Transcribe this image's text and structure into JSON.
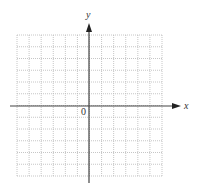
{
  "diagram": {
    "type": "coordinate-grid",
    "x_axis_label": "x",
    "y_axis_label": "y",
    "origin_label": "0",
    "grid": {
      "columns": 12,
      "rows": 12,
      "origin_column_index": 6,
      "origin_row_index": 6,
      "line_style": "dotted",
      "line_color": "#b8b8b8"
    },
    "axis_color": "#333333"
  }
}
